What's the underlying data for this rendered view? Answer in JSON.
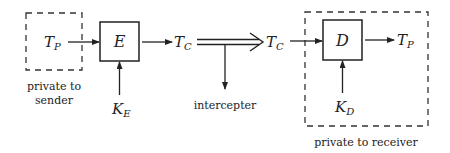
{
  "diagram": {
    "type": "cryptosystem-flow",
    "nodes": {
      "plaintext_in": {
        "main": "T",
        "sub": "P"
      },
      "encrypt": {
        "label": "E"
      },
      "ciphertext_out": {
        "main": "T",
        "sub": "C"
      },
      "ciphertext_in": {
        "main": "T",
        "sub": "C"
      },
      "decrypt": {
        "label": "D"
      },
      "plaintext_out": {
        "main": "T",
        "sub": "P"
      },
      "key_encrypt": {
        "main": "K",
        "sub": "E"
      },
      "key_decrypt": {
        "main": "K",
        "sub": "D"
      }
    },
    "labels": {
      "sender_line1": "private to",
      "sender_line2": "sender",
      "intercepter": "intercepter",
      "receiver": "private to receiver"
    },
    "edges": [
      {
        "from": "plaintext_in",
        "to": "encrypt"
      },
      {
        "from": "key_encrypt",
        "to": "encrypt"
      },
      {
        "from": "encrypt",
        "to": "ciphertext_out"
      },
      {
        "from": "ciphertext_out",
        "to": "ciphertext_in",
        "style": "double"
      },
      {
        "from": "channel",
        "to": "intercepter"
      },
      {
        "from": "ciphertext_in",
        "to": "decrypt"
      },
      {
        "from": "key_decrypt",
        "to": "decrypt"
      },
      {
        "from": "decrypt",
        "to": "plaintext_out"
      }
    ],
    "colors": {
      "stroke": "#222222",
      "background": "#ffffff"
    }
  }
}
